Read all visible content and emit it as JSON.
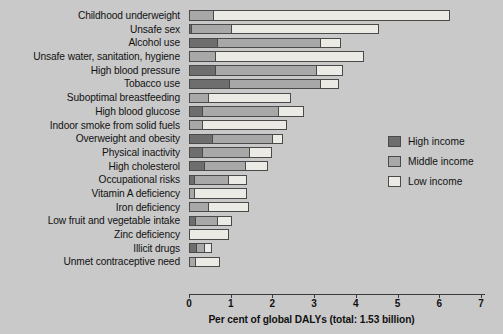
{
  "chart_data": {
    "type": "bar",
    "orientation": "horizontal",
    "stacked": true,
    "title": "",
    "xlabel": "Per cent of global DALYs (total: 1.53 billion)",
    "ylabel": "",
    "xlim": [
      0,
      7.05
    ],
    "xticks": [
      0,
      1,
      2,
      3,
      4,
      5,
      6,
      7
    ],
    "xtick_labels": [
      "0",
      "1",
      "2",
      "3",
      "4",
      "5",
      "6",
      "7"
    ],
    "grid": false,
    "legend_position": "right",
    "categories": [
      "Childhood underweight",
      "Unsafe sex",
      "Alcohol use",
      "Unsafe water, sanitation, hygiene",
      "High blood pressure",
      "Tobacco use",
      "Suboptimal breastfeeding",
      "High blood glucose",
      "Indoor smoke from solid fuels",
      "Overweight and obesity",
      "Physical inactivity",
      "High cholesterol",
      "Occupational risks",
      "Vitamin A deficiency",
      "Iron deficiency",
      "Low fruit and vegetable intake",
      "Zinc deficiency",
      "Illicit drugs",
      "Unmet contraceptive need"
    ],
    "series": [
      {
        "name": "High income",
        "color": "#6e6e6e",
        "values": [
          0.0,
          0.02,
          0.65,
          0.0,
          0.6,
          0.95,
          0.0,
          0.3,
          0.0,
          0.55,
          0.3,
          0.35,
          0.1,
          0.0,
          0.0,
          0.12,
          0.0,
          0.17,
          0.0
        ]
      },
      {
        "name": "Middle income",
        "color": "#a8a8a8",
        "values": [
          0.55,
          0.98,
          2.5,
          0.6,
          2.45,
          2.2,
          0.45,
          1.85,
          0.3,
          1.45,
          1.15,
          1.0,
          0.85,
          0.1,
          0.45,
          0.55,
          0.0,
          0.2,
          0.12
        ]
      },
      {
        "name": "Low income",
        "color": "#eceae4",
        "values": [
          5.72,
          3.55,
          0.5,
          3.6,
          0.65,
          0.45,
          2.0,
          0.6,
          2.05,
          0.25,
          0.55,
          0.55,
          0.45,
          1.3,
          1.0,
          0.35,
          0.95,
          0.18,
          0.63
        ]
      }
    ],
    "totals": [
      6.27,
      4.55,
      3.65,
      4.2,
      3.7,
      3.6,
      2.45,
      2.75,
      2.35,
      2.25,
      2.0,
      1.9,
      1.4,
      1.4,
      1.45,
      1.02,
      0.95,
      0.55,
      0.75
    ]
  },
  "legend": {
    "items": [
      {
        "label": "High income",
        "swatch": "high"
      },
      {
        "label": "Middle income",
        "swatch": "mid"
      },
      {
        "label": "Low income",
        "swatch": "low"
      }
    ]
  },
  "colors": {
    "background": "#c9c9c9",
    "high_income": "#6e6e6e",
    "middle_income": "#a8a8a8",
    "low_income": "#eceae4",
    "outline": "#4a4a4a",
    "axis": "#3b3b3b",
    "text": "#111111"
  }
}
